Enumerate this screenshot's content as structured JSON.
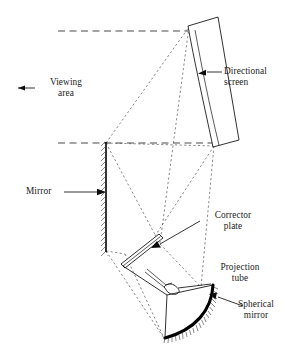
{
  "figure": {
    "background_color": "#ffffff",
    "ink_color": "#1a1a1a",
    "ray_color": "#5f5f5f"
  },
  "labels": {
    "viewing_area": {
      "line1": "Viewing",
      "line2": "area",
      "icon": "arrow-left-icon"
    },
    "directional_screen": {
      "line1": "Directional",
      "line2": "screen",
      "icon": "leader-arrow-left-icon"
    },
    "mirror": {
      "line1": "Mirror",
      "icon": "leader-arrow-right-icon"
    },
    "corrector_plate": {
      "line1": "Corrector",
      "line2": "plate",
      "icon": "leader-arrow-left-icon"
    },
    "projection_tube": {
      "line1": "Projection",
      "line2": "tube",
      "icon": "leader-line-icon"
    },
    "spherical_mirror": {
      "line1": "Spherical",
      "line2": "mirror",
      "icon": "leader-arrow-left-icon"
    }
  },
  "components": [
    {
      "id": "directional-screen",
      "name": "Directional screen",
      "shape": "tilted-elongated-panel"
    },
    {
      "id": "flat-mirror",
      "name": "Mirror",
      "shape": "vertical-hatched-line"
    },
    {
      "id": "corrector-plate",
      "name": "Corrector plate",
      "shape": "thin-tilted-bar"
    },
    {
      "id": "projection-tube",
      "name": "Projection tube",
      "shape": "crt-funnel"
    },
    {
      "id": "spherical-mirror",
      "name": "Spherical mirror",
      "shape": "thick-hatched-arc"
    }
  ],
  "optical_paths": {
    "axis_lines": [
      {
        "name": "upper-viewing-axis",
        "style": "dashed"
      },
      {
        "name": "lower-viewing-axis",
        "style": "dashed"
      }
    ],
    "ray_bundle_style": "dashed"
  }
}
